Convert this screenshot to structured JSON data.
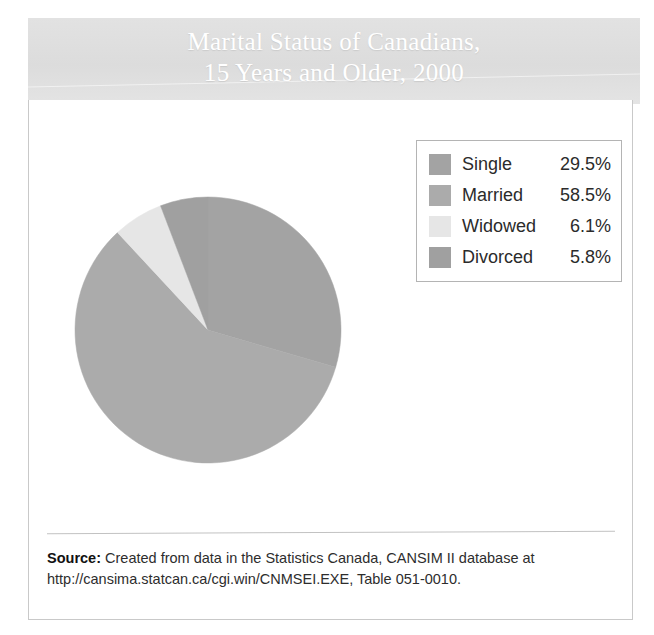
{
  "title": {
    "line1": "Marital Status of Canadians,",
    "line2": "15 Years and Older, 2000"
  },
  "source": {
    "label": "Source:",
    "text": " Created from data in the Statistics Canada, CANSIM II database at http://cansima.statcan.ca/cgi.win/CNMSEI.EXE, Table 051-0010."
  },
  "legend": {
    "entries": [
      {
        "label": "Single",
        "value": "29.5%",
        "color": "#a3a3a3"
      },
      {
        "label": "Married",
        "value": "58.5%",
        "color": "#ababab"
      },
      {
        "label": "Widowed",
        "value": "6.1%",
        "color": "#e6e6e6"
      },
      {
        "label": "Divorced",
        "value": "5.8%",
        "color": "#a0a0a0"
      }
    ]
  },
  "chart_data": {
    "type": "pie",
    "title": "Marital Status of Canadians, 15 Years and Older, 2000",
    "categories": [
      "Single",
      "Married",
      "Widowed",
      "Divorced"
    ],
    "values": [
      29.5,
      58.5,
      6.1,
      5.8
    ],
    "unit": "%",
    "colors": [
      "#a3a3a3",
      "#ababab",
      "#e6e6e6",
      "#a0a0a0"
    ],
    "start_angle_deg": 0,
    "direction": "clockwise",
    "legend_position": "top-right",
    "labels_on_slices": false,
    "xlabel": "",
    "ylabel": ""
  }
}
